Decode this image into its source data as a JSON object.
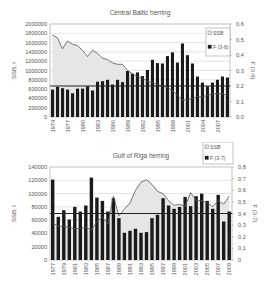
{
  "chart_data": [
    {
      "type": "bar",
      "title": "Central Baltic herring",
      "xlabel": "",
      "ylabel": "SSB, t",
      "y2label": "F (3-6)",
      "ylim": [
        0,
        2000000
      ],
      "y2lim": [
        0,
        0.6
      ],
      "yticks": [
        "0",
        "200000",
        "400000",
        "600000",
        "800000",
        "1000000",
        "1200000",
        "1400000",
        "1600000",
        "1800000",
        "2000000"
      ],
      "y2ticks": [
        "0,0",
        "0,1",
        "0,2",
        "0,3",
        "0,4",
        "0,5",
        "0,6"
      ],
      "xtick_labels": [
        "1974",
        "1977",
        "1980",
        "1983",
        "1986",
        "1989",
        "1992",
        "1995",
        "1998",
        "2001",
        "2004",
        "2007"
      ],
      "legend": [
        {
          "label": "SSB",
          "swatch": "light"
        },
        {
          "label": "F (3-6)",
          "swatch": "dark"
        }
      ],
      "legend_position": "upper right inside",
      "grid": true,
      "categories": [
        1974,
        1975,
        1976,
        1977,
        1978,
        1979,
        1980,
        1981,
        1982,
        1983,
        1984,
        1985,
        1986,
        1987,
        1988,
        1989,
        1990,
        1991,
        1992,
        1993,
        1994,
        1995,
        1996,
        1997,
        1998,
        1999,
        2000,
        2001,
        2002,
        2003,
        2004,
        2005,
        2006,
        2007,
        2008,
        2009
      ],
      "series": [
        {
          "name": "bars",
          "axis": "left",
          "kind": "bar",
          "color": "#1a1a1a",
          "values": [
            590000,
            650000,
            620000,
            590000,
            510000,
            610000,
            610000,
            660000,
            570000,
            760000,
            770000,
            800000,
            700000,
            800000,
            750000,
            990000,
            930000,
            960000,
            880000,
            1010000,
            1230000,
            1160000,
            1150000,
            1310000,
            1390000,
            1170000,
            1580000,
            1330000,
            1150000,
            870000,
            740000,
            660000,
            740000,
            800000,
            870000,
            850000
          ]
        },
        {
          "name": "line-area",
          "axis": "right",
          "kind": "area",
          "color": "#555555",
          "fill": "#e6e6e6",
          "values": [
            0.53,
            0.51,
            0.44,
            0.49,
            0.47,
            0.46,
            0.43,
            0.39,
            0.43,
            0.41,
            0.38,
            0.37,
            0.35,
            0.34,
            0.34,
            0.3,
            0.28,
            0.26,
            0.25,
            0.23,
            0.22,
            0.21,
            0.2,
            0.19,
            0.17,
            0.14,
            0.11,
            0.11,
            0.12,
            0.13,
            0.13,
            0.14,
            0.15,
            0.15,
            0.15,
            0.14
          ]
        }
      ],
      "reference_line": {
        "axis": "right",
        "value": 0.2
      }
    },
    {
      "type": "bar",
      "title": "Gulf of Riga herring",
      "xlabel": "",
      "ylabel": "SSB, t",
      "y2label": "F (3-7)",
      "ylim": [
        0,
        140000
      ],
      "y2lim": [
        0,
        0.8
      ],
      "yticks": [
        "0",
        "20000",
        "40000",
        "60000",
        "80000",
        "100000",
        "120000",
        "140000"
      ],
      "y2ticks": [
        "0",
        "0,1",
        "0,2",
        "0,3",
        "0,4",
        "0,5",
        "0,6",
        "0,7",
        "0,8"
      ],
      "xtick_labels": [
        "1977",
        "1979",
        "1981",
        "1983",
        "1985",
        "1987",
        "1989",
        "1991",
        "1993",
        "1995",
        "1997",
        "1999",
        "2001",
        "2003",
        "2005",
        "2007",
        "2009"
      ],
      "legend": [
        {
          "label": "SSB",
          "swatch": "light"
        },
        {
          "label": "F (3-7)",
          "swatch": "dark"
        }
      ],
      "legend_position": "top right outside",
      "grid": true,
      "categories": [
        1977,
        1978,
        1979,
        1980,
        1981,
        1982,
        1983,
        1984,
        1985,
        1986,
        1987,
        1988,
        1989,
        1990,
        1991,
        1992,
        1993,
        1994,
        1995,
        1996,
        1997,
        1998,
        1999,
        2000,
        2001,
        2002,
        2003,
        2004,
        2005,
        2006,
        2007,
        2008,
        2009
      ],
      "series": [
        {
          "name": "bars",
          "axis": "left",
          "kind": "bar",
          "color": "#1a1a1a",
          "values": [
            121000,
            65000,
            75000,
            61000,
            80000,
            73000,
            82000,
            124000,
            94000,
            89000,
            73000,
            93000,
            63000,
            41000,
            44000,
            47000,
            41000,
            42000,
            63000,
            68000,
            93000,
            82000,
            77000,
            80000,
            95000,
            81000,
            96000,
            100000,
            89000,
            77000,
            98000,
            58000,
            73000
          ]
        },
        {
          "name": "line-area",
          "axis": "right",
          "kind": "area",
          "color": "#555555",
          "fill": "#e6e6e6",
          "values": [
            0.32,
            0.29,
            0.29,
            0.28,
            0.27,
            0.27,
            0.28,
            0.26,
            0.33,
            0.37,
            0.31,
            0.55,
            0.38,
            0.44,
            0.49,
            0.6,
            0.67,
            0.69,
            0.65,
            0.59,
            0.57,
            0.51,
            0.47,
            0.48,
            0.46,
            0.58,
            0.51,
            0.51,
            0.49,
            0.46,
            0.51,
            0.48,
            0.55
          ]
        }
      ],
      "reference_line": {
        "axis": "right",
        "value": 0.4
      }
    }
  ],
  "layout": [
    {
      "plot": {
        "x": 50,
        "y": 24,
        "w": 180,
        "h": 93
      },
      "title_y": 12,
      "legend": {
        "x": 206,
        "y": 28,
        "w": 24,
        "h": 28
      }
    },
    {
      "plot": {
        "x": 50,
        "y": 167,
        "w": 182,
        "h": 93
      },
      "title_y": 155,
      "legend": {
        "x": 203,
        "y": 142,
        "w": 30,
        "h": 22
      }
    }
  ]
}
